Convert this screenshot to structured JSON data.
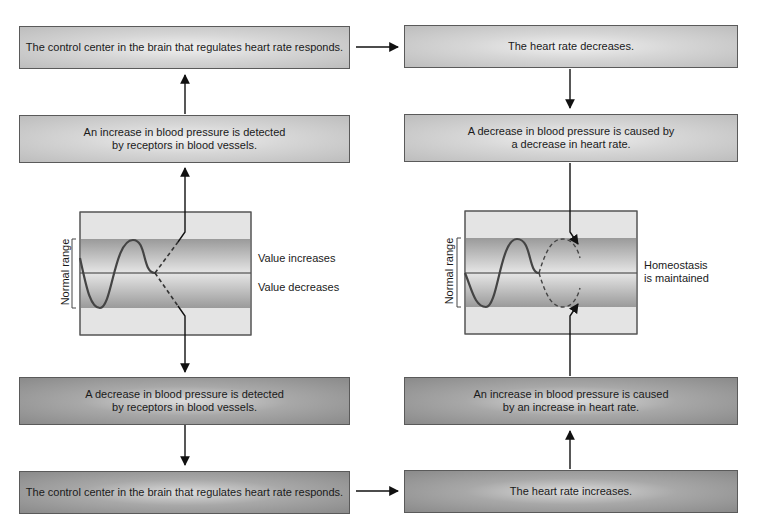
{
  "diagram": {
    "type": "negative-feedback-loop",
    "topic": "Homeostatic regulation of blood pressure",
    "left_column": {
      "top_box": {
        "text": "The control center in the brain that regulates heart rate responds."
      },
      "upper_box": {
        "line1": "An increase in blood pressure is detected",
        "line2": "by receptors in blood vessels."
      },
      "graph": {
        "axis_label": "Normal range",
        "label_increase": "Value increases",
        "label_decrease": "Value decreases"
      },
      "lower_box": {
        "line1": "A decrease in blood pressure is detected",
        "line2": "by receptors in blood vessels."
      },
      "bottom_box": {
        "text": "The control center in the brain that regulates heart rate responds."
      }
    },
    "right_column": {
      "top_box": {
        "text": "The heart rate decreases."
      },
      "upper_box": {
        "line1": "A decrease in blood pressure is caused by",
        "line2": "a decrease in heart rate."
      },
      "graph": {
        "axis_label": "Normal range",
        "label_line1": "Homeostasis",
        "label_line2": "is maintained"
      },
      "lower_box": {
        "line1": "An increase in blood pressure is caused",
        "line2": "by an increase in heart rate."
      },
      "bottom_box": {
        "text": "The heart rate increases."
      }
    },
    "colors": {
      "upper_boxes": "#d0d0d0",
      "lower_boxes": "#a0a0a0",
      "normal_band": "#a8a8a8",
      "outer_band": "#e2e2e2",
      "line": "#1a1a1a",
      "wave": "#444444"
    }
  }
}
